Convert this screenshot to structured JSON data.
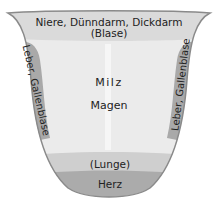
{
  "diagram": {
    "type": "tongue-organ-map",
    "colors": {
      "body": "#ebebeb",
      "top_band": "#dadada",
      "side_band": "#a9a9a9",
      "lunge_band": "#cfcfcf",
      "herz_band": "#ababab",
      "outline": "#8a8a8a",
      "text": "#222222"
    },
    "regions": {
      "top": {
        "line1": "Niere, Dünndarm, Dickdarm",
        "line2": "(Blase)"
      },
      "left_side": "Leber, Gallenblase",
      "right_side": "Leber, Gallenblase",
      "center_upper": "Milz",
      "center_lower": "Magen",
      "lunge": "(Lunge)",
      "herz": "Herz"
    }
  }
}
